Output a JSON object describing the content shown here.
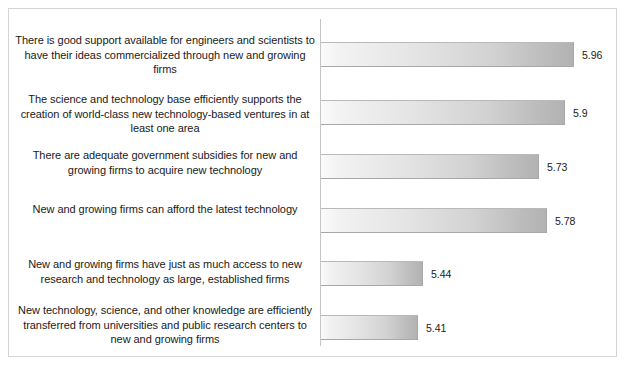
{
  "chart_data": {
    "type": "bar",
    "orientation": "horizontal",
    "title": "",
    "subtitle": "",
    "xlabel": "",
    "ylabel": "",
    "grid": false,
    "legend": false,
    "axis_baseline": 5.0,
    "xlim": [
      5.0,
      6.05
    ],
    "categories": [
      "There is good support available for engineers and scientists to have their ideas commercialized through new and growing firms",
      "The science and technology base efficiently supports the creation of world-class new technology-based ventures in at least one area",
      "There are adequate government subsidies for new and growing firms to acquire new technology",
      "New and growing firms can afford the latest technology",
      "New and growing firms have just as much access to new research and technology as large, established firms",
      "New technology, science, and other knowledge are efficiently transferred from universities and public research centers to new and growing firms"
    ],
    "values": [
      5.96,
      5.9,
      5.73,
      5.78,
      5.44,
      5.41
    ],
    "value_labels": [
      "5.96",
      "5.9",
      "5.73",
      "5.78",
      "5.44",
      "5.41"
    ],
    "bar_fill_start": "#fbfbfb",
    "bar_fill_end": "#b2b2b2",
    "bar_border": "#a8a8a8",
    "axis_color": "#c6c6c6",
    "frame_border": "#d4d4d4",
    "text_color": "#1a1a1a"
  },
  "layout": {
    "label_tops": [
      24,
      83,
      139,
      193,
      248,
      294
    ],
    "bar_tops": [
      33,
      91,
      145,
      199,
      252,
      306
    ],
    "bar_height": 25,
    "bar_widths": [
      253,
      244,
      218,
      226,
      102,
      97
    ]
  }
}
